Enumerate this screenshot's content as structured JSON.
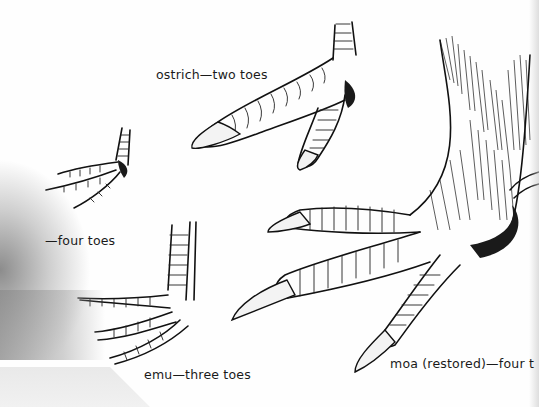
{
  "figure": {
    "captions": {
      "ostrich": "ostrich—two toes",
      "four_toed": "—four toes",
      "emu": "emu—three toes",
      "moa": "moa (restored)—four t"
    },
    "illustrations": [
      {
        "id": "ostrich-foot",
        "toes": 2
      },
      {
        "id": "small-four-toed-foot",
        "toes": 4
      },
      {
        "id": "emu-foot",
        "toes": 3
      },
      {
        "id": "moa-foot",
        "toes": 4,
        "note": "restored"
      }
    ],
    "colors": {
      "ink": "#111111",
      "paper": "#fefefe",
      "page_shadow": "#8c8c8c"
    }
  }
}
